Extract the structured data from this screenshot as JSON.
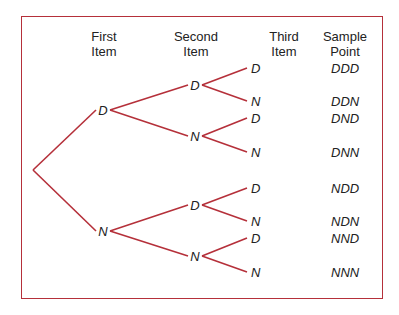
{
  "diagram": {
    "type": "tree",
    "frame_color": "#b5303a",
    "line_color": "#b5303a",
    "headers": {
      "first": [
        "First",
        "Item"
      ],
      "second": [
        "Second",
        "Item"
      ],
      "third": [
        "Third",
        "Item"
      ],
      "sample": [
        "Sample",
        "Point"
      ]
    },
    "first_level": [
      {
        "label": "D",
        "x": 103,
        "y": 110
      },
      {
        "label": "N",
        "x": 103,
        "y": 231
      }
    ],
    "second_level": [
      {
        "label": "D",
        "x": 195,
        "y": 85,
        "parent": 0
      },
      {
        "label": "N",
        "x": 195,
        "y": 136,
        "parent": 0
      },
      {
        "label": "D",
        "x": 195,
        "y": 205,
        "parent": 1
      },
      {
        "label": "N",
        "x": 195,
        "y": 256,
        "parent": 1
      }
    ],
    "third_level": [
      {
        "label": "D",
        "y": 68,
        "parent": 0
      },
      {
        "label": "N",
        "y": 101,
        "parent": 0
      },
      {
        "label": "D",
        "y": 118,
        "parent": 1
      },
      {
        "label": "N",
        "y": 152,
        "parent": 1
      },
      {
        "label": "D",
        "y": 188,
        "parent": 2
      },
      {
        "label": "N",
        "y": 221,
        "parent": 2
      },
      {
        "label": "D",
        "y": 238,
        "parent": 3
      },
      {
        "label": "N",
        "y": 272,
        "parent": 3
      }
    ],
    "sample_points": [
      "DDD",
      "DDN",
      "DND",
      "DNN",
      "NDD",
      "NDN",
      "NND",
      "NNN"
    ],
    "root": {
      "x": 33,
      "y": 170
    }
  }
}
